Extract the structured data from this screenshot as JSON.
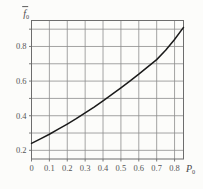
{
  "figure": {
    "name": "graph-f0-vs-P0",
    "background_color": "#fcfcfa",
    "grid_color": "#8d8d8d",
    "frame_color": "#6d6d6d",
    "curve_color": "#1a1a1a"
  },
  "axis_labels": {
    "y_symbol": "f",
    "y_subscript": "0",
    "y_overbar": true,
    "x_symbol": "P",
    "x_subscript": "0"
  },
  "chart_data": {
    "type": "line",
    "title": "",
    "xlabel": "P0",
    "ylabel": "f0",
    "xlim": [
      0,
      0.85
    ],
    "ylim": [
      0.15,
      0.95
    ],
    "grid": true,
    "legend": "none",
    "xticks": [
      0,
      0.1,
      0.2,
      0.3,
      0.4,
      0.5,
      0.6,
      0.7,
      0.8
    ],
    "xticklabels": [
      "0",
      "0.1",
      "0.2",
      "0.3",
      "0.4",
      "0.5",
      "0.6",
      "0.7",
      "0.8"
    ],
    "yticks": [
      0.2,
      0.4,
      0.6,
      0.8
    ],
    "yticklabels": [
      "0.2",
      "0.4",
      "0.6",
      "0.8"
    ],
    "y_gridlines": [
      0.2,
      0.3,
      0.4,
      0.5,
      0.6,
      0.7,
      0.8,
      0.9
    ],
    "x": [
      0.0,
      0.05,
      0.1,
      0.15,
      0.2,
      0.25,
      0.3,
      0.35,
      0.4,
      0.45,
      0.5,
      0.55,
      0.6,
      0.65,
      0.7,
      0.75,
      0.8,
      0.85
    ],
    "values": [
      0.24,
      0.266,
      0.293,
      0.322,
      0.352,
      0.383,
      0.416,
      0.45,
      0.486,
      0.523,
      0.561,
      0.6,
      0.64,
      0.682,
      0.724,
      0.778,
      0.84,
      0.91
    ],
    "series": [
      {
        "name": "f0",
        "values": [
          0.24,
          0.266,
          0.293,
          0.322,
          0.352,
          0.383,
          0.416,
          0.45,
          0.486,
          0.523,
          0.561,
          0.6,
          0.64,
          0.682,
          0.724,
          0.778,
          0.84,
          0.91
        ]
      }
    ]
  }
}
